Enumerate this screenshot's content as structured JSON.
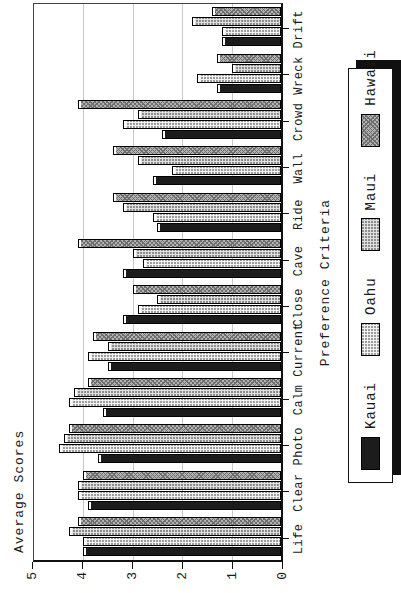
{
  "chart_data": {
    "type": "bar",
    "title": "",
    "ylabel": "Average Scores",
    "xlabel": "Preference Criteria",
    "ylim": [
      0,
      5
    ],
    "yticks": [
      "0",
      "1",
      "2",
      "3",
      "4",
      "5"
    ],
    "grid": true,
    "legend_position": "bottom",
    "orientation": "landscape chart rotated 90 degrees counterclockwise on portrait page",
    "categories": [
      "Life",
      "Clear",
      "Photo",
      "Calm",
      "Current",
      "Close",
      "Cave",
      "Ride",
      "Wall",
      "Crowd",
      "Wreck",
      "Drift"
    ],
    "series": [
      {
        "name": "Kauai",
        "pattern": "solid-black",
        "color": "#1c1c1c",
        "values": [
          4.0,
          3.9,
          3.7,
          3.6,
          3.5,
          3.2,
          3.2,
          2.5,
          2.6,
          2.4,
          1.3,
          1.2
        ]
      },
      {
        "name": "Oahu",
        "pattern": "light-stipple",
        "color": "#f2f2f2",
        "values": [
          4.0,
          4.1,
          4.5,
          4.3,
          3.9,
          2.9,
          2.8,
          2.6,
          2.2,
          3.2,
          1.7,
          1.2
        ]
      },
      {
        "name": "Maui",
        "pattern": "light-stipple-2",
        "color": "#e0e0e0",
        "values": [
          4.3,
          4.1,
          4.4,
          4.2,
          3.5,
          2.5,
          3.0,
          3.2,
          2.9,
          2.9,
          1.0,
          1.8
        ]
      },
      {
        "name": "Hawaii",
        "pattern": "gray-crosshatch",
        "color": "#b2b2b2",
        "values": [
          4.1,
          4.0,
          4.3,
          3.9,
          3.8,
          3.0,
          4.1,
          3.4,
          3.4,
          4.1,
          1.3,
          1.4
        ]
      }
    ]
  },
  "colors": {
    "background": "#ffffff",
    "axis": "#111111",
    "gridline": "#c8c8c8",
    "text": "#1a1a1a",
    "legend_shadow": "#101010"
  }
}
